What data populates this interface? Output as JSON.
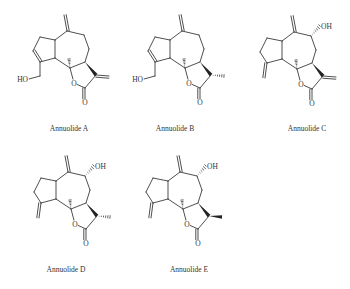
{
  "figure": {
    "ink_color": "#222222",
    "compounds": [
      {
        "id": "A",
        "name": "Annuolide A",
        "origin": [
          67,
          31
        ],
        "label_pos": [
          69,
          130
        ],
        "ring5": "endocyclic-double-bond",
        "c4_substituent": "CH2OH",
        "c8_substituent": "none",
        "c11_substituent": "exo-methylene",
        "c11_stereo": "none"
      },
      {
        "id": "B",
        "name": "Annuolide B",
        "origin": [
          182,
          31
        ],
        "label_pos": [
          175,
          130
        ],
        "ring5": "endocyclic-double-bond",
        "c4_substituent": "CH2OH",
        "c8_substituent": "none",
        "c11_substituent": "methyl",
        "c11_stereo": "hash"
      },
      {
        "id": "C",
        "name": "Annuolide C",
        "origin": [
          294,
          32
        ],
        "label_pos": [
          307,
          130
        ],
        "ring5": "exo-methylene",
        "c4_substituent": "none",
        "c8_substituent": "OH",
        "c11_substituent": "exo-methylene",
        "c11_stereo": "none"
      },
      {
        "id": "D",
        "name": "Annuolide D",
        "origin": [
          68,
          172
        ],
        "label_pos": [
          66,
          271
        ],
        "ring5": "exo-methylene",
        "c4_substituent": "none",
        "c8_substituent": "OH",
        "c11_substituent": "methyl",
        "c11_stereo": "hash"
      },
      {
        "id": "E",
        "name": "Annuolide E",
        "origin": [
          180,
          172
        ],
        "label_pos": [
          189,
          271
        ],
        "ring5": "exo-methylene",
        "c4_substituent": "none",
        "c8_substituent": "OH",
        "c11_substituent": "methyl",
        "c11_stereo": "wedge"
      }
    ],
    "atom_labels": {
      "hydroxyl_left": "HO",
      "hydroxyl_right": "OH",
      "oxygen": "O"
    }
  }
}
